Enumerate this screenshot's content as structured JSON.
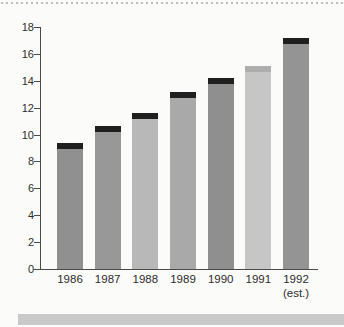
{
  "chart_data": {
    "type": "bar",
    "title": "",
    "xlabel": "",
    "ylabel": "",
    "categories": [
      "1986",
      "1987",
      "1988",
      "1989",
      "1990",
      "1991",
      "1992"
    ],
    "category_note": {
      "index": 6,
      "text": "(est.)"
    },
    "values": [
      9.4,
      10.6,
      11.6,
      13.2,
      14.2,
      15.1,
      17.2
    ],
    "bar_colors": [
      "#909090",
      "#989898",
      "#b8b8b8",
      "#a9a9a9",
      "#8f8f8f",
      "#c6c6c6",
      "#949494"
    ],
    "cap_colors": [
      "#1f1f1f",
      "#1f1f1f",
      "#1f1f1f",
      "#1f1f1f",
      "#1f1f1f",
      "#aeaeae",
      "#1f1f1f"
    ],
    "ylim": [
      0,
      18
    ],
    "yticks": [
      0,
      2,
      4,
      6,
      8,
      10,
      12,
      14,
      16,
      18
    ],
    "grid": false,
    "legend": "none"
  },
  "decorations": {
    "top_dotted_rule_color": "#bcbcbc",
    "bottom_band_color": "#c9c9c9",
    "axis_color": "#4a4a4a",
    "label_color": "#2e2e2e",
    "background": "#fbfbfa"
  }
}
